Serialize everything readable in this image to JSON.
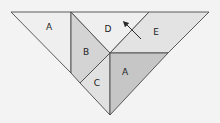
{
  "diagram": {
    "title": "",
    "colors": {
      "background": "#f3f3f3",
      "stroke": "#4a4a4a",
      "label": "#222222"
    },
    "pieces": [
      {
        "id": "A-left",
        "label": "A",
        "fill": "#efefef",
        "points": "11,12 71,12 71,73",
        "label_x": 49,
        "label_y": 27
      },
      {
        "id": "B",
        "label": "B",
        "fill": "#d4d4d4",
        "points": "71,12 110,53 80,83 71,73",
        "label_x": 86,
        "label_y": 52
      },
      {
        "id": "D",
        "label": "D",
        "fill": "#efefef",
        "points": "71,12 149,12 110,53",
        "label_x": 108,
        "label_y": 29
      },
      {
        "id": "E",
        "label": "E",
        "fill": "#e3e3e3",
        "points": "149,12 209,12 168,53 110,53",
        "label_x": 156,
        "label_y": 32
      },
      {
        "id": "C",
        "label": "C",
        "fill": "#e1e1e1",
        "points": "80,83 110,53 110,115",
        "label_x": 97,
        "label_y": 83
      },
      {
        "id": "A-right",
        "label": "A",
        "fill": "#c6c6c6",
        "points": "110,53 168,53 110,115",
        "label_x": 125,
        "label_y": 72
      }
    ],
    "arrow": {
      "x1": 141,
      "y1": 39,
      "x2": 125,
      "y2": 23,
      "direction": "up-left"
    }
  }
}
